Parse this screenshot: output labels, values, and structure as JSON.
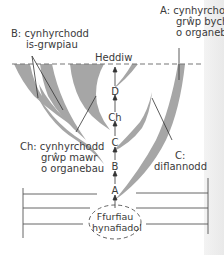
{
  "diagram": {
    "type": "evolutionary-branching-diagram",
    "present_label": "Heddiw",
    "labels": {
      "A": {
        "line1": "A: cynhyrchodd",
        "line2": "grŵp bychan",
        "line3": "o organebau"
      },
      "B": {
        "line1": "B: cynhyrchodd",
        "line2": "is-grwpiau"
      },
      "Ch": {
        "line1": "Ch: cynhyrchodd",
        "line2": "grŵp mawr",
        "line3": "o organebau"
      },
      "C": {
        "line1": "C:",
        "line2": "diflannodd"
      }
    },
    "sequence": [
      "D",
      "Ch",
      "C",
      "B",
      "A"
    ],
    "ancestral_forms": {
      "line1": "Ffurfiau",
      "line2": "hynafiadol"
    },
    "colors": {
      "branch_fill": "#a6a6a6",
      "line": "#333333",
      "dashed_line": "#777777",
      "page_edge": "#ececec"
    }
  }
}
